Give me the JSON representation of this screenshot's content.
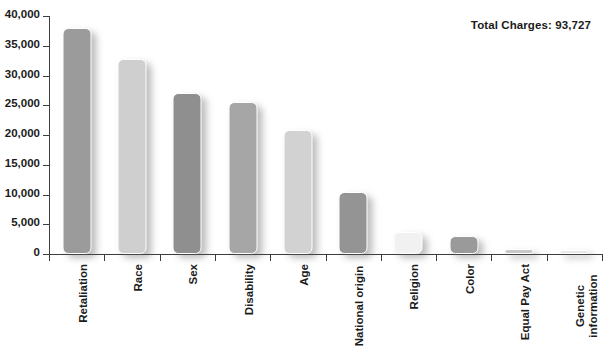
{
  "annotation": {
    "total_charges_label": "Total Charges: 93,727"
  },
  "chart_data": {
    "type": "bar",
    "title": "",
    "subtitle": "",
    "xlabel": "",
    "ylabel": "",
    "categories": [
      "Retaliation",
      "Race",
      "Sex",
      "Disability",
      "Age",
      "National origin",
      "Religion",
      "Color",
      "Equal Pay Act",
      "Genetic information"
    ],
    "values": [
      38000,
      32700,
      27000,
      25500,
      20900,
      10400,
      3700,
      3000,
      800,
      200
    ],
    "value_labels": [
      "",
      "",
      "",
      "",
      "",
      "",
      "",
      "",
      "",
      ""
    ],
    "ylim": [
      0,
      40000
    ],
    "yticks": [
      0,
      5000,
      10000,
      15000,
      20000,
      25000,
      30000,
      35000,
      40000
    ],
    "ytick_labels": [
      "0",
      "5,000",
      "10,000",
      "15,000",
      "20,000",
      "25,000",
      "30,000",
      "35,000",
      "40,000"
    ],
    "grid": false,
    "legend": false,
    "legend_position": "none",
    "annotations": [
      "Total Charges: 93,727"
    ],
    "bar_colors": [
      "#9b9b9b",
      "#cfcfcf",
      "#8f8f8f",
      "#a6a6a6",
      "#d2d2d2",
      "#949494",
      "#f1f1f1",
      "#9a9a9a",
      "#c9c9c9",
      "#e8e8e8"
    ]
  },
  "axis": {
    "axis_color": "#3d3d3d",
    "text_color": "#1b1b1b"
  }
}
